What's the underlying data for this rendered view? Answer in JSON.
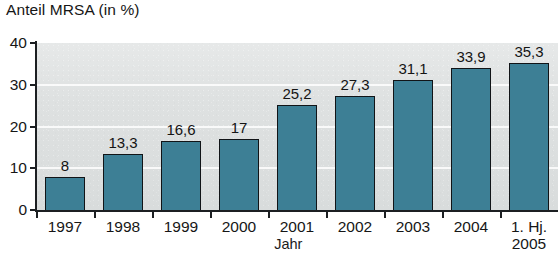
{
  "chart_data": {
    "type": "bar",
    "title": "Anteil MRSA (in %)",
    "xlabel": "Jahr",
    "ylabel": "Anteil MRSA (in %)",
    "categories": [
      "1997",
      "1998",
      "1999",
      "2000",
      "2001",
      "2002",
      "2003",
      "2004",
      "1. Hj. 2005"
    ],
    "category_lines": [
      [
        "1997"
      ],
      [
        "1998"
      ],
      [
        "1999"
      ],
      [
        "2000"
      ],
      [
        "2001"
      ],
      [
        "2002"
      ],
      [
        "2003"
      ],
      [
        "2004"
      ],
      [
        "1. Hj.",
        "2005"
      ]
    ],
    "values": [
      8,
      13.3,
      16.6,
      17,
      25.2,
      27.3,
      31.1,
      33.9,
      35.3
    ],
    "value_labels": [
      "8",
      "13,3",
      "16,6",
      "17",
      "25,2",
      "27,3",
      "31,1",
      "33,9",
      "35,3"
    ],
    "ylim": [
      0,
      40
    ],
    "yticks": [
      0,
      10,
      20,
      30,
      40
    ],
    "ytick_labels": [
      "0",
      "10",
      "20",
      "30",
      "40"
    ],
    "gridlines": [
      10,
      20,
      30
    ],
    "grid": true,
    "legend": null,
    "colors": {
      "bar_fill": "#3d7f95",
      "bar_edge": "#111417",
      "plot_background": "#dcdfdf",
      "gridline": "#ffffff",
      "axis": "#1c1f22",
      "text": "#161616",
      "page_background": "#ffffff"
    }
  }
}
